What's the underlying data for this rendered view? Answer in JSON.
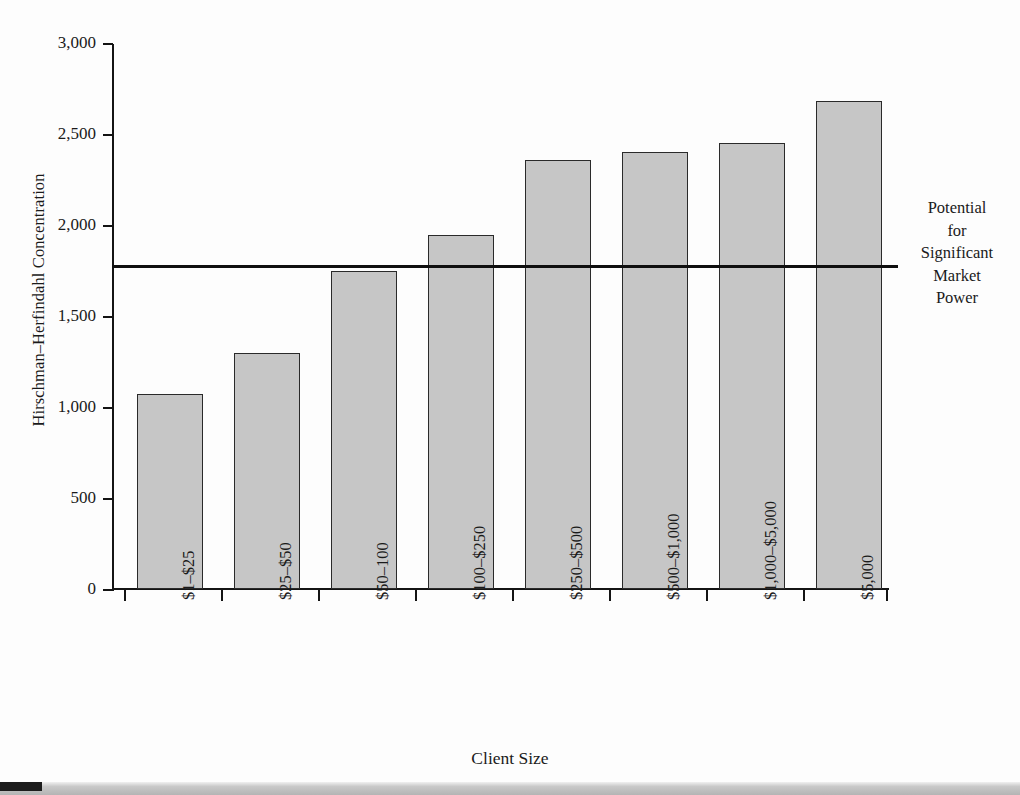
{
  "chart_data": {
    "type": "bar",
    "title": "",
    "xlabel": "Client Size",
    "ylabel": "Hirschman–Herfindahl Concentration",
    "categories": [
      "$1–$25",
      "$25–$50",
      "$50–100",
      "$100–$250",
      "$250–$500",
      "$500–$1,000",
      "$1,000–$5,000",
      "$5,000"
    ],
    "values": [
      1070,
      1295,
      1745,
      1945,
      2355,
      2400,
      2450,
      2680
    ],
    "ylim": [
      0,
      3000
    ],
    "yticks": [
      0,
      500,
      1000,
      1500,
      2000,
      2500,
      3000
    ],
    "ytick_labels": [
      "0",
      "500",
      "1,000",
      "1,500",
      "2,000",
      "2,500",
      "3,000"
    ],
    "grid": false,
    "legend": "none",
    "bar_fill_color": "#c6c6c6",
    "bar_edge_color": "#2a2a2a",
    "annotations": [
      {
        "name": "threshold-line",
        "value": 1780,
        "color": "#0f0f0f",
        "label_lines": [
          "Potential",
          "for",
          "Significant",
          "Market",
          "Power"
        ]
      }
    ]
  },
  "axis": {
    "y_title": "Hirschman–Herfindahl Concentration",
    "x_title": "Client Size"
  },
  "threshold": {
    "line1": "Potential",
    "line2": "for",
    "line3": "Significant",
    "line4": "Market",
    "line5": "Power"
  }
}
